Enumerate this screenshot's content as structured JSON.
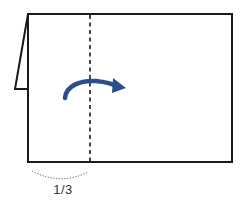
{
  "diagram": {
    "type": "fold-instruction",
    "fold_line": {
      "style": "dashed",
      "position_fraction": "1/3"
    },
    "arrow": {
      "direction": "right",
      "color": "#2B4F8C",
      "icon": "curved-arrow-right-icon"
    },
    "measure": {
      "label": "1/3",
      "style": "dotted-arc"
    },
    "colors": {
      "outline": "#1a1a1a",
      "arrow": "#2B4F8C",
      "dotted_arc": "#555555",
      "label": "#333333",
      "background": "#ffffff"
    }
  }
}
